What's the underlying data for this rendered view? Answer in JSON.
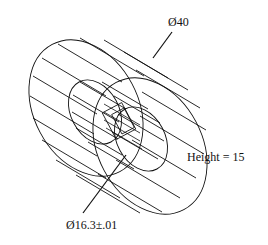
{
  "drawing": {
    "type": "isometric wireframe cylinder with bore",
    "stroke_color": "#111111",
    "background": "#ffffff"
  },
  "labels": {
    "outer_diameter": "Ø40",
    "height": "Height = 15",
    "inner_diameter": "Ø16.3±.01"
  }
}
